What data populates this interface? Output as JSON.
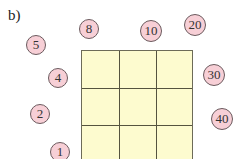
{
  "figure": {
    "label": "b)",
    "grid": {
      "rows": 3,
      "cols": 3,
      "fill": "#fdfbcf",
      "line_color": "#55533f"
    },
    "nodes": [
      {
        "value": "5",
        "x": 36,
        "y": 45
      },
      {
        "value": "8",
        "x": 89,
        "y": 29
      },
      {
        "value": "10",
        "x": 151,
        "y": 31
      },
      {
        "value": "20",
        "x": 195,
        "y": 25
      },
      {
        "value": "4",
        "x": 58,
        "y": 78
      },
      {
        "value": "30",
        "x": 214,
        "y": 75
      },
      {
        "value": "2",
        "x": 40,
        "y": 114
      },
      {
        "value": "40",
        "x": 222,
        "y": 119
      },
      {
        "value": "1",
        "x": 60,
        "y": 152
      }
    ],
    "node_fill": "#f7cfd6"
  }
}
